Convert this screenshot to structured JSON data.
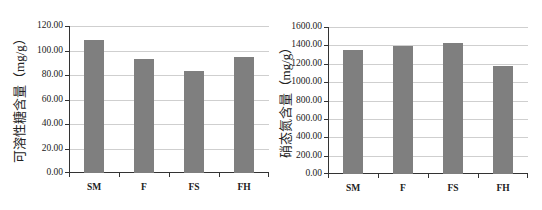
{
  "chart_data": [
    {
      "type": "bar",
      "title": "",
      "xlabel": "",
      "ylabel": "可溶性糖含量（mg/g）",
      "categories": [
        "SM",
        "F",
        "FS",
        "FH"
      ],
      "values": [
        108.5,
        93.0,
        83.0,
        95.0
      ],
      "ylim": [
        0,
        120
      ],
      "yticks": [
        "0.00",
        "20.00",
        "40.00",
        "60.00",
        "80.00",
        "100.00",
        "120.00"
      ],
      "grid": true,
      "legend": null,
      "bar_color": "#7f7f7f"
    },
    {
      "type": "bar",
      "title": "",
      "xlabel": "",
      "ylabel": "硝态氮含量（mg/g）",
      "categories": [
        "SM",
        "F",
        "FS",
        "FH"
      ],
      "values": [
        1350,
        1390,
        1425,
        1175
      ],
      "ylim": [
        0,
        1600
      ],
      "yticks": [
        "0.00",
        "200.00",
        "400.00",
        "600.00",
        "800.00",
        "1000.00",
        "1200.00",
        "1400.00",
        "1600.00"
      ],
      "grid": true,
      "legend": null,
      "bar_color": "#7f7f7f"
    }
  ],
  "left": {
    "ylabel": "可溶性糖含量（mg/g）",
    "yticks": [
      "0.00",
      "20.00",
      "40.00",
      "60.00",
      "80.00",
      "100.00",
      "120.00"
    ],
    "categories": [
      "SM",
      "F",
      "FS",
      "FH"
    ]
  },
  "right": {
    "ylabel": "硝态氮含量（mg/g）",
    "yticks": [
      "0.00",
      "200.00",
      "400.00",
      "600.00",
      "800.00",
      "1000.00",
      "1200.00",
      "1400.00",
      "1600.00"
    ],
    "categories": [
      "SM",
      "F",
      "FS",
      "FH"
    ]
  }
}
